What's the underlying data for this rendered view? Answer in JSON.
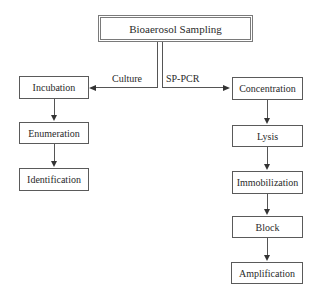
{
  "diagram": {
    "title": "Bioaerosol Sampling",
    "root": {
      "label": "Bioaerosol Sampling"
    },
    "branches": {
      "left": {
        "label": "Culture",
        "steps": [
          "Incubation",
          "Enumeration",
          "Identification"
        ]
      },
      "right": {
        "label": "SP-PCR",
        "steps": [
          "Concentration",
          "Lysis",
          "Immobilization",
          "Block",
          "Amplification"
        ]
      }
    },
    "edges": [
      {
        "from": "Bioaerosol Sampling",
        "to": "Incubation",
        "label": "Culture"
      },
      {
        "from": "Bioaerosol Sampling",
        "to": "Concentration",
        "label": "SP-PCR"
      },
      {
        "from": "Incubation",
        "to": "Enumeration"
      },
      {
        "from": "Enumeration",
        "to": "Identification"
      },
      {
        "from": "Concentration",
        "to": "Lysis"
      },
      {
        "from": "Lysis",
        "to": "Immobilization"
      },
      {
        "from": "Immobilization",
        "to": "Block"
      },
      {
        "from": "Block",
        "to": "Amplification"
      }
    ]
  }
}
